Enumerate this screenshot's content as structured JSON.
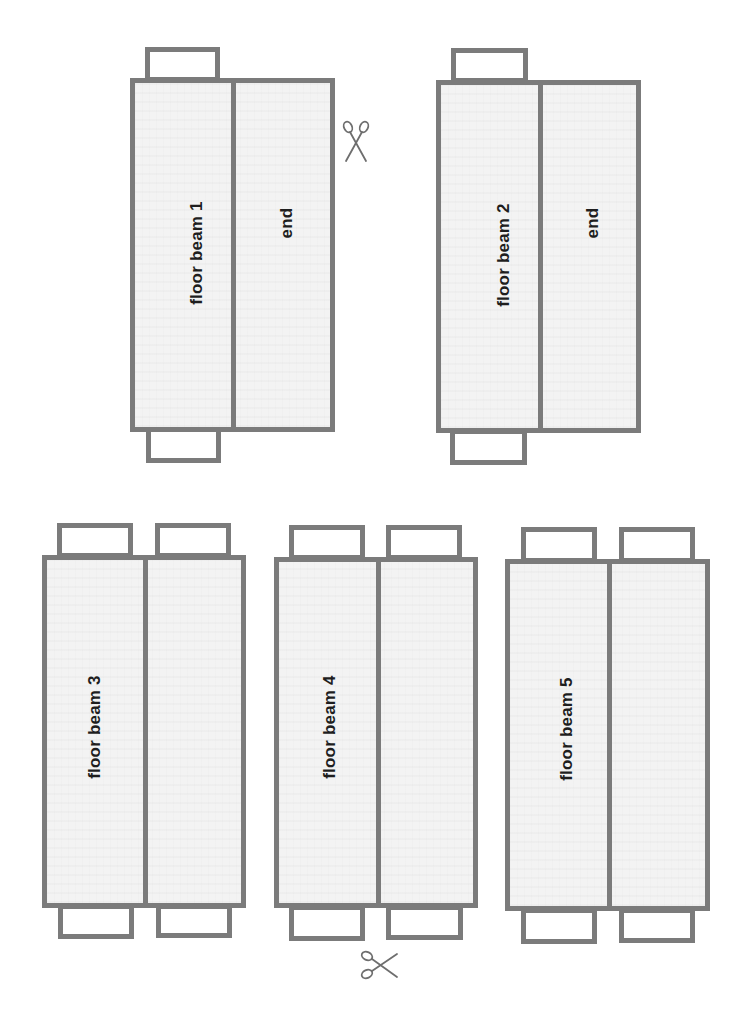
{
  "diagram": {
    "title": "",
    "colors": {
      "outline": "#7b7b7b",
      "panel_fill": "#f3f3f3",
      "tab_fill": "#ffffff",
      "text": "#1e1e1e",
      "scissors": "#6e6e6e"
    },
    "beams": [
      {
        "label": "floor beam 1",
        "end_label": "end",
        "tabs_top": 1,
        "tabs_bottom": 1
      },
      {
        "label": "floor beam 2",
        "end_label": "end",
        "tabs_top": 1,
        "tabs_bottom": 1
      },
      {
        "label": "floor beam 3",
        "end_label": "",
        "tabs_top": 2,
        "tabs_bottom": 2
      },
      {
        "label": "floor beam 4",
        "end_label": "",
        "tabs_top": 2,
        "tabs_bottom": 2
      },
      {
        "label": "floor beam 5",
        "end_label": "",
        "tabs_top": 2,
        "tabs_bottom": 2
      }
    ],
    "icons": [
      {
        "name": "scissors-icon",
        "location": "right of floor beam 1",
        "orientation": "vertical"
      },
      {
        "name": "scissors-icon",
        "location": "below floor beam 4",
        "orientation": "horizontal"
      }
    ]
  }
}
